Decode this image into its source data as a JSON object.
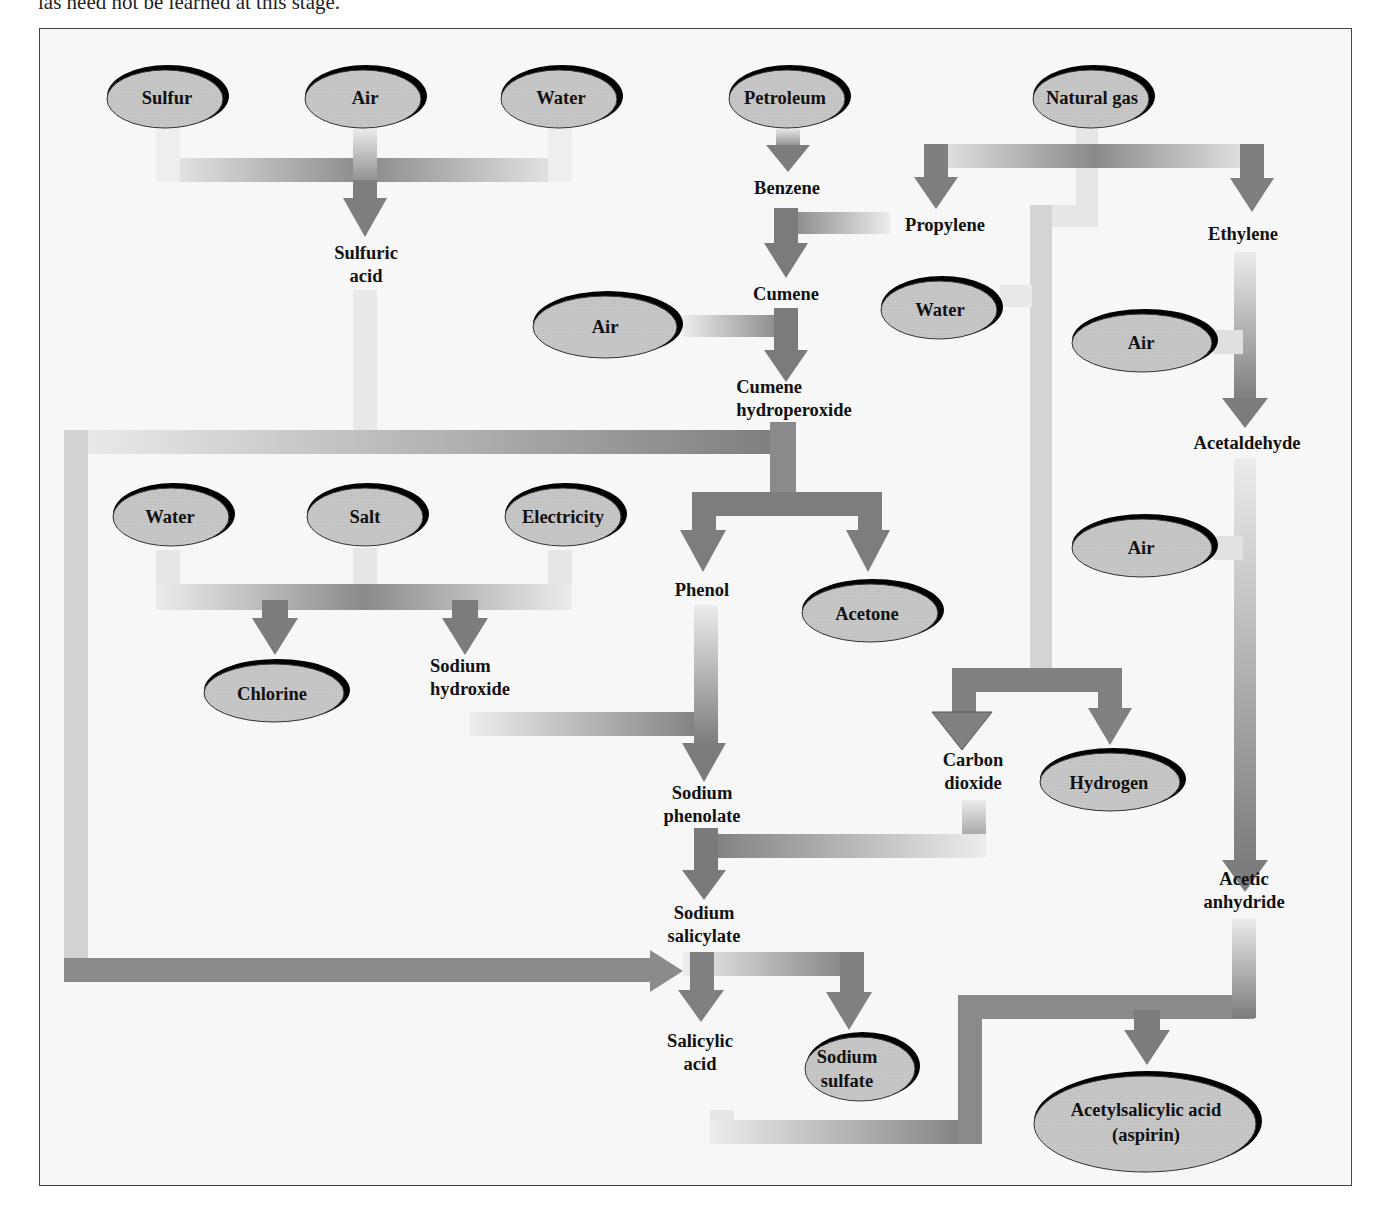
{
  "caption_fragment": "las need not be learned at this stage.",
  "diagram": {
    "type": "flowchart",
    "raw_materials": [
      {
        "id": "sulfur",
        "label": "Sulfur"
      },
      {
        "id": "air1",
        "label": "Air"
      },
      {
        "id": "water1",
        "label": "Water"
      },
      {
        "id": "petroleum",
        "label": "Petroleum"
      },
      {
        "id": "natural_gas",
        "label": "Natural gas"
      },
      {
        "id": "air2",
        "label": "Air"
      },
      {
        "id": "water2",
        "label": "Water"
      },
      {
        "id": "air3",
        "label": "Air"
      },
      {
        "id": "air4",
        "label": "Air"
      },
      {
        "id": "water3",
        "label": "Water"
      },
      {
        "id": "salt",
        "label": "Salt"
      },
      {
        "id": "electricity",
        "label": "Electricity"
      }
    ],
    "intermediates": [
      {
        "id": "sulfuric_acid",
        "label": "Sulfuric\nacid",
        "line1": "Sulfuric",
        "line2": "acid"
      },
      {
        "id": "benzene",
        "label": "Benzene"
      },
      {
        "id": "propylene",
        "label": "Propylene"
      },
      {
        "id": "ethylene",
        "label": "Ethylene"
      },
      {
        "id": "cumene",
        "label": "Cumene"
      },
      {
        "id": "cumene_hydroperoxide",
        "line1": "Cumene",
        "line2": "hydroperoxide"
      },
      {
        "id": "acetaldehyde",
        "label": "Acetaldehyde"
      },
      {
        "id": "phenol",
        "label": "Phenol"
      },
      {
        "id": "sodium_hydroxide",
        "line1": "Sodium",
        "line2": "hydroxide"
      },
      {
        "id": "carbon_dioxide",
        "line1": "Carbon",
        "line2": "dioxide"
      },
      {
        "id": "sodium_phenolate",
        "line1": "Sodium",
        "line2": "phenolate"
      },
      {
        "id": "sodium_salicylate",
        "line1": "Sodium",
        "line2": "salicylate"
      },
      {
        "id": "acetic_anhydride",
        "line1": "Acetic",
        "line2": "anhydride"
      },
      {
        "id": "salicylic_acid",
        "line1": "Salicylic",
        "line2": "acid"
      }
    ],
    "products": [
      {
        "id": "chlorine",
        "label": "Chlorine"
      },
      {
        "id": "acetone",
        "label": "Acetone"
      },
      {
        "id": "hydrogen",
        "label": "Hydrogen"
      },
      {
        "id": "sodium_sulfate",
        "line1": "Sodium",
        "line2": "sulfate"
      },
      {
        "id": "aspirin",
        "line1": "Acetylsalicylic acid",
        "line2": "(aspirin)"
      }
    ],
    "edges": [
      {
        "from": [
          "Sulfur",
          "Air",
          "Water"
        ],
        "to": "Sulfuric acid"
      },
      {
        "from": [
          "Petroleum"
        ],
        "to": "Benzene"
      },
      {
        "from": [
          "Natural gas"
        ],
        "to": [
          "Propylene",
          "Ethylene"
        ]
      },
      {
        "from": [
          "Benzene",
          "Propylene"
        ],
        "to": "Cumene"
      },
      {
        "from": [
          "Cumene",
          "Air"
        ],
        "to": "Cumene hydroperoxide"
      },
      {
        "from": [
          "Cumene hydroperoxide",
          "Sulfuric acid"
        ],
        "to": [
          "Phenol",
          "Acetone"
        ]
      },
      {
        "from": [
          "Ethylene",
          "Air"
        ],
        "to": "Acetaldehyde"
      },
      {
        "from": [
          "Acetaldehyde",
          "Air"
        ],
        "to": "Acetic anhydride"
      },
      {
        "from": [
          "Natural gas",
          "Water"
        ],
        "to": [
          "Carbon dioxide",
          "Hydrogen"
        ]
      },
      {
        "from": [
          "Water",
          "Salt",
          "Electricity"
        ],
        "to": [
          "Chlorine",
          "Sodium hydroxide"
        ]
      },
      {
        "from": [
          "Phenol",
          "Sodium hydroxide"
        ],
        "to": "Sodium phenolate"
      },
      {
        "from": [
          "Sodium phenolate",
          "Carbon dioxide"
        ],
        "to": "Sodium salicylate"
      },
      {
        "from": [
          "Sodium salicylate",
          "Sulfuric acid"
        ],
        "to": [
          "Salicylic acid",
          "Sodium sulfate"
        ]
      },
      {
        "from": [
          "Salicylic acid",
          "Acetic anhydride"
        ],
        "to": "Acetylsalicylic acid (aspirin)"
      }
    ],
    "colors": {
      "ellipse_fill": "#c4c4c4",
      "ellipse_shadow": "#000000",
      "arrow_dark": "#7d7d7d",
      "arrow_light": "#e8e8e8",
      "frame_bg": "#f7f7f7",
      "frame_border": "#444444"
    }
  }
}
